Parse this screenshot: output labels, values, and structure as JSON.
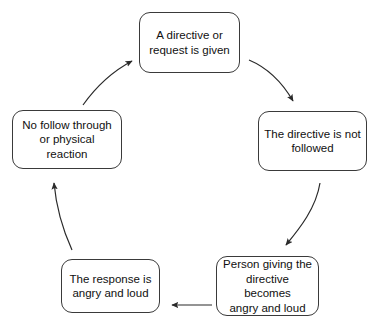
{
  "diagram": {
    "type": "cycle",
    "direction": "clockwise",
    "background_color": "#ffffff",
    "stroke_color": "#3a3a3a",
    "text_color": "#101010",
    "nodes": [
      {
        "id": "directive-given",
        "order": 1,
        "label": "A directive or\nrequest is given"
      },
      {
        "id": "not-followed",
        "order": 2,
        "label": "The directive is not\nfollowed"
      },
      {
        "id": "giver-angry",
        "order": 3,
        "label": "Person giving the\ndirective becomes\nangry and loud"
      },
      {
        "id": "response-angry",
        "order": 4,
        "label": "The response is\nangry and loud"
      },
      {
        "id": "no-follow-through",
        "order": 5,
        "label": "No follow through\nor physical reaction"
      }
    ],
    "edges": [
      {
        "id": "edge-1",
        "from": "directive-given",
        "to": "not-followed",
        "shape": "curved",
        "direction": "down-right"
      },
      {
        "id": "edge-2",
        "from": "not-followed",
        "to": "giver-angry",
        "shape": "curved",
        "direction": "down-left"
      },
      {
        "id": "edge-3",
        "from": "giver-angry",
        "to": "response-angry",
        "shape": "straight",
        "direction": "left"
      },
      {
        "id": "edge-4",
        "from": "response-angry",
        "to": "no-follow-through",
        "shape": "curved",
        "direction": "up-left"
      },
      {
        "id": "edge-5",
        "from": "no-follow-through",
        "to": "directive-given",
        "shape": "curved",
        "direction": "up-right"
      }
    ]
  }
}
